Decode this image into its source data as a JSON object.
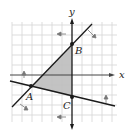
{
  "diagram": {
    "type": "linear inequalities graph",
    "axes": {
      "x_label": "x",
      "y_label": "y"
    },
    "grid": {
      "x_range": [
        -6,
        4
      ],
      "y_range": [
        -4,
        6
      ],
      "step": 1
    },
    "points": [
      {
        "label": "A",
        "x": -4,
        "y": -1
      },
      {
        "label": "B",
        "x": 0,
        "y": 3
      },
      {
        "label": "C",
        "x": 0,
        "y": -2
      }
    ],
    "lines": [
      {
        "name": "line AB",
        "through": [
          "A",
          "B"
        ],
        "shade_arrow": "right/below"
      },
      {
        "name": "line AC",
        "through": [
          "A",
          "C"
        ],
        "shade_arrow": "above"
      },
      {
        "name": "y-axis boundary",
        "through": [
          "B",
          "C"
        ],
        "shade_arrow": "left"
      }
    ],
    "shaded_region": "triangle ABC",
    "colors": {
      "shade": "#bdbdbd",
      "grid": "#d0d0d0",
      "line": "#1a1a1a"
    }
  }
}
